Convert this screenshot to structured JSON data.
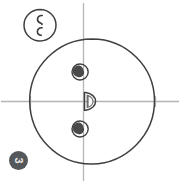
{
  "figure": {
    "background_color": "#ffffff",
    "stroke_color": "#3a3a3a",
    "axis_color": "#b5b5b5",
    "fill_color": "#4a4a4a",
    "elements": {
      "main_circle": {
        "name": "main-circle",
        "center_x": 92,
        "center_y": 101,
        "radius": 62
      },
      "vertical_axis": {
        "name": "vertical-axis",
        "x": 83,
        "y_start": 3,
        "y_end": 181
      },
      "horizontal_axis": {
        "name": "horizontal-axis",
        "y": 101,
        "x_start": 1,
        "x_end": 179
      },
      "tick_left": {
        "name": "tick-left",
        "x": 30,
        "y": 101
      },
      "tick_right": {
        "name": "tick-right",
        "x": 155,
        "y": 101
      },
      "upper_small_circle": {
        "name": "upper-small-circle",
        "center_x": 80,
        "center_y": 72,
        "radius": 8,
        "inner_crescent": true
      },
      "lower_small_circle": {
        "name": "lower-small-circle",
        "center_x": 80,
        "center_y": 129,
        "radius": 8,
        "inner_crescent": true
      },
      "center_half_disc": {
        "name": "center-half-disc",
        "center_x": 88,
        "center_y": 101,
        "radius": 9,
        "orientation": "right"
      },
      "inset_circle": {
        "name": "inset-circle",
        "center_x": 40,
        "center_y": 25,
        "radius": 16,
        "marks": [
          "comma-mark-upper",
          "comma-mark-lower"
        ]
      }
    }
  },
  "badge": {
    "label": "3",
    "background_color": "#55585a",
    "text_color": "#e8e8e8"
  }
}
